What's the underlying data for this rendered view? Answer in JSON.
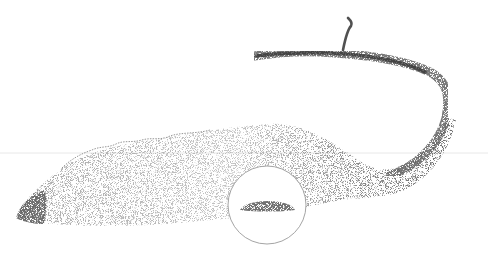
{
  "figure": {
    "type": "scientific stipple illustration",
    "inset": "circular cross-section detail",
    "colors": {
      "background": "#ffffff",
      "ink": "#2a2a2a",
      "inset_outline": "#9a9a9a",
      "guide_line": "#e6e6e6"
    }
  },
  "caption": {
    "text": ""
  }
}
